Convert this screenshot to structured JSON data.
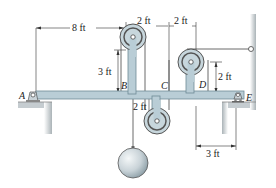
{
  "diagram": {
    "type": "statics-beam-pulley-system",
    "points": {
      "A": "A",
      "B": "B",
      "C": "C",
      "D": "D",
      "E": "E"
    },
    "dimensions": {
      "AB": "8 ft",
      "BC": "2 ft",
      "CD": "2 ft",
      "pulleyB_height": "3 ft",
      "pulleyC_depth": "2 ft",
      "pulleyD_height": "2 ft",
      "E_offset": "3 ft"
    },
    "colors": {
      "beam": "#b9cdd6",
      "beam_edge": "#6e8a96",
      "pulley": "#c7d6dc",
      "weight": "#d5dde2",
      "ground": "#c9cfd2",
      "line": "#333333"
    }
  }
}
